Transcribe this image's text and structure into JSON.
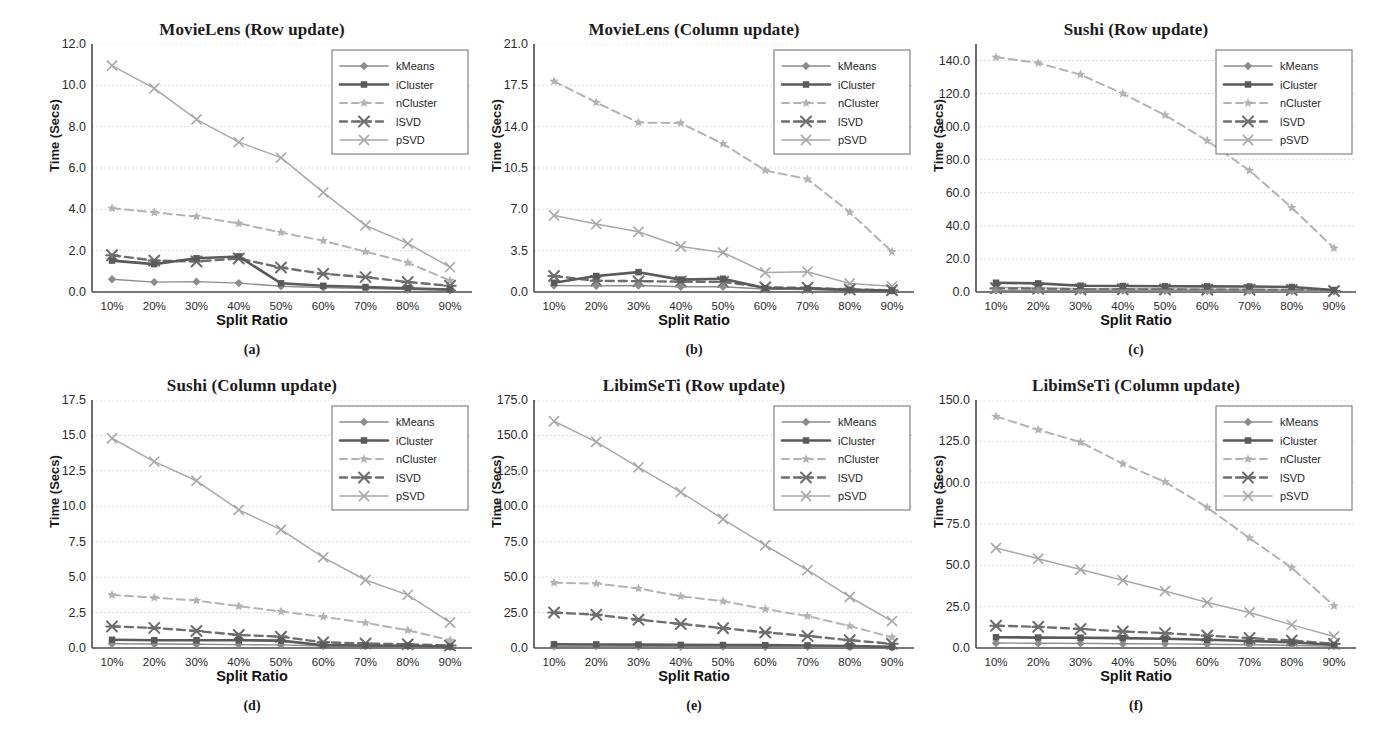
{
  "figure": {
    "xlabel": "Split Ratio",
    "ylabel": "Time (Secs)",
    "categories": [
      "10%",
      "20%",
      "30%",
      "40%",
      "50%",
      "60%",
      "70%",
      "80%",
      "90%"
    ],
    "legend_entries": [
      "kMeans",
      "iCluster",
      "nCluster",
      "lSVD",
      "pSVD"
    ],
    "colors": {
      "kMeans": "#8c8c8c",
      "iCluster": "#5a5a5a",
      "nCluster": "#b3b3b3",
      "lSVD": "#6e6e6e",
      "pSVD": "#a8a8a8",
      "axis": "#4a4a4a",
      "grid": "#d9d9d9",
      "text": "#262626"
    }
  },
  "chart_data": [
    {
      "type": "line",
      "panel": "a",
      "caption": "(a)",
      "title": "MovieLens (Row update)",
      "xlabel": "Split Ratio",
      "ylabel": "Time (Secs)",
      "categories": [
        "10%",
        "20%",
        "30%",
        "40%",
        "50%",
        "60%",
        "70%",
        "80%",
        "90%"
      ],
      "ylim": [
        0.0,
        12.0
      ],
      "yticks": [
        "0.0",
        "2.0",
        "4.0",
        "6.0",
        "8.0",
        "10.0",
        "12.0"
      ],
      "ytick_values": [
        0.0,
        2.0,
        4.0,
        6.0,
        8.0,
        10.0,
        12.0
      ],
      "grid": true,
      "legend_position": "top-right",
      "series": [
        {
          "name": "kMeans",
          "values": [
            0.62,
            0.48,
            0.5,
            0.43,
            0.28,
            0.22,
            0.17,
            0.12,
            0.08
          ]
        },
        {
          "name": "iCluster",
          "values": [
            1.52,
            1.35,
            1.63,
            1.72,
            0.42,
            0.3,
            0.24,
            0.18,
            0.12
          ]
        },
        {
          "name": "nCluster",
          "values": [
            4.05,
            3.85,
            3.65,
            3.32,
            2.88,
            2.48,
            1.95,
            1.42,
            0.55
          ]
        },
        {
          "name": "lSVD",
          "values": [
            1.78,
            1.52,
            1.48,
            1.62,
            1.18,
            0.88,
            0.72,
            0.48,
            0.3
          ]
        },
        {
          "name": "pSVD",
          "values": [
            10.95,
            9.85,
            8.35,
            7.25,
            6.5,
            4.82,
            3.22,
            2.35,
            1.2
          ]
        }
      ]
    },
    {
      "type": "line",
      "panel": "b",
      "caption": "(b)",
      "title": "MovieLens (Column update)",
      "xlabel": "Split Ratio",
      "ylabel": "Time (Secs)",
      "categories": [
        "10%",
        "20%",
        "30%",
        "40%",
        "50%",
        "60%",
        "70%",
        "80%",
        "90%"
      ],
      "ylim": [
        0.0,
        21.0
      ],
      "yticks": [
        "0.0",
        "3.5",
        "7.0",
        "10.5",
        "14.0",
        "17.5",
        "21.0"
      ],
      "ytick_values": [
        0.0,
        3.5,
        7.0,
        10.5,
        14.0,
        17.5,
        21.0
      ],
      "grid": true,
      "legend_position": "top-right",
      "series": [
        {
          "name": "kMeans",
          "values": [
            0.55,
            0.52,
            0.55,
            0.45,
            0.45,
            0.25,
            0.2,
            0.15,
            0.1
          ]
        },
        {
          "name": "iCluster",
          "values": [
            0.78,
            1.35,
            1.68,
            1.05,
            1.12,
            0.32,
            0.3,
            0.18,
            0.12
          ]
        },
        {
          "name": "nCluster",
          "values": [
            17.85,
            16.05,
            14.35,
            14.3,
            12.55,
            10.3,
            9.55,
            6.75,
            3.4
          ]
        },
        {
          "name": "lSVD",
          "values": [
            1.35,
            0.95,
            0.92,
            0.88,
            0.85,
            0.4,
            0.35,
            0.22,
            0.15
          ]
        },
        {
          "name": "pSVD",
          "values": [
            6.48,
            5.75,
            5.1,
            3.85,
            3.35,
            1.65,
            1.72,
            0.72,
            0.48
          ]
        }
      ]
    },
    {
      "type": "line",
      "panel": "c",
      "caption": "(c)",
      "title": "Sushi (Row update)",
      "xlabel": "Split Ratio",
      "ylabel": "Time (Secs)",
      "categories": [
        "10%",
        "20%",
        "30%",
        "40%",
        "50%",
        "60%",
        "70%",
        "80%",
        "90%"
      ],
      "ylim": [
        0.0,
        150.0
      ],
      "yticks": [
        "0.0",
        "20.0",
        "40.0",
        "60.0",
        "80.0",
        "100.0",
        "120.0",
        "140.0"
      ],
      "ytick_values": [
        0.0,
        20.0,
        40.0,
        60.0,
        80.0,
        100.0,
        120.0,
        140.0
      ],
      "grid": true,
      "legend_position": "top-right",
      "series": [
        {
          "name": "kMeans",
          "values": [
            1.0,
            1.0,
            0.9,
            0.9,
            0.8,
            0.8,
            0.7,
            0.6,
            0.3
          ]
        },
        {
          "name": "iCluster",
          "values": [
            5.6,
            5.2,
            3.8,
            3.6,
            3.5,
            3.4,
            3.3,
            3.0,
            1.2
          ]
        },
        {
          "name": "nCluster",
          "values": [
            142.0,
            138.5,
            131.5,
            120.0,
            107.0,
            91.5,
            73.5,
            51.0,
            26.5
          ]
        },
        {
          "name": "lSVD",
          "values": [
            2.2,
            2.0,
            1.6,
            1.6,
            1.5,
            1.4,
            1.3,
            1.2,
            0.6
          ]
        },
        {
          "name": "pSVD",
          "values": [
            2.8,
            2.5,
            2.0,
            1.9,
            1.8,
            1.7,
            1.6,
            1.4,
            0.7
          ]
        }
      ]
    },
    {
      "type": "line",
      "panel": "d",
      "caption": "(d)",
      "title": "Sushi (Column update)",
      "xlabel": "Split Ratio",
      "ylabel": "Time (Secs)",
      "categories": [
        "10%",
        "20%",
        "30%",
        "40%",
        "50%",
        "60%",
        "70%",
        "80%",
        "90%"
      ],
      "ylim": [
        0.0,
        17.5
      ],
      "yticks": [
        "0.0",
        "2.5",
        "5.0",
        "7.5",
        "10.0",
        "12.5",
        "15.0",
        "17.5"
      ],
      "ytick_values": [
        0.0,
        2.5,
        5.0,
        7.5,
        10.0,
        12.5,
        15.0,
        17.5
      ],
      "grid": true,
      "legend_position": "top-right",
      "series": [
        {
          "name": "kMeans",
          "values": [
            0.3,
            0.28,
            0.26,
            0.24,
            0.22,
            0.14,
            0.12,
            0.1,
            0.06
          ]
        },
        {
          "name": "iCluster",
          "values": [
            0.58,
            0.55,
            0.55,
            0.55,
            0.52,
            0.2,
            0.18,
            0.16,
            0.1
          ]
        },
        {
          "name": "nCluster",
          "values": [
            3.75,
            3.55,
            3.35,
            2.95,
            2.58,
            2.2,
            1.78,
            1.25,
            0.55
          ]
        },
        {
          "name": "lSVD",
          "values": [
            1.52,
            1.42,
            1.2,
            0.92,
            0.8,
            0.4,
            0.32,
            0.26,
            0.18
          ]
        },
        {
          "name": "pSVD",
          "values": [
            14.8,
            13.15,
            11.8,
            9.75,
            8.35,
            6.4,
            4.8,
            3.75,
            1.8
          ]
        }
      ]
    },
    {
      "type": "line",
      "panel": "e",
      "caption": "(e)",
      "title": "LibimSeTi (Row update)",
      "xlabel": "Split Ratio",
      "ylabel": "Time (Secs)",
      "categories": [
        "10%",
        "20%",
        "30%",
        "40%",
        "50%",
        "60%",
        "70%",
        "80%",
        "90%"
      ],
      "ylim": [
        0.0,
        175.0
      ],
      "yticks": [
        "0.0",
        "25.0",
        "50.0",
        "75.0",
        "100.0",
        "125.0",
        "150.0",
        "175.0"
      ],
      "ytick_values": [
        0.0,
        25.0,
        50.0,
        75.0,
        100.0,
        125.0,
        150.0,
        175.0
      ],
      "grid": true,
      "legend_position": "top-right",
      "series": [
        {
          "name": "kMeans",
          "values": [
            1.2,
            1.2,
            1.1,
            1.0,
            1.0,
            0.9,
            0.8,
            0.6,
            0.4
          ]
        },
        {
          "name": "iCluster",
          "values": [
            2.6,
            2.5,
            2.4,
            2.2,
            2.1,
            2.0,
            1.8,
            1.4,
            0.8
          ]
        },
        {
          "name": "nCluster",
          "values": [
            46.0,
            45.5,
            42.0,
            36.5,
            33.0,
            27.5,
            22.5,
            15.5,
            7.5
          ]
        },
        {
          "name": "lSVD",
          "values": [
            25.0,
            23.5,
            20.0,
            17.0,
            14.0,
            11.0,
            8.5,
            5.5,
            3.0
          ]
        },
        {
          "name": "pSVD",
          "values": [
            160.0,
            145.5,
            127.5,
            110.0,
            91.0,
            72.5,
            55.0,
            36.0,
            19.0
          ]
        }
      ]
    },
    {
      "type": "line",
      "panel": "f",
      "caption": "(f)",
      "title": "LibimSeTi (Column update)",
      "xlabel": "Split Ratio",
      "ylabel": "Time (Secs)",
      "categories": [
        "10%",
        "20%",
        "30%",
        "40%",
        "50%",
        "60%",
        "70%",
        "80%",
        "90%"
      ],
      "ylim": [
        0.0,
        150.0
      ],
      "yticks": [
        "0.0",
        "25.0",
        "50.0",
        "75.0",
        "100.0",
        "125.0",
        "150.0"
      ],
      "ytick_values": [
        0.0,
        25.0,
        50.0,
        75.0,
        100.0,
        125.0,
        150.0
      ],
      "grid": true,
      "legend_position": "top-right",
      "series": [
        {
          "name": "kMeans",
          "values": [
            3.0,
            2.9,
            2.8,
            2.6,
            2.5,
            2.3,
            2.0,
            1.7,
            1.0
          ]
        },
        {
          "name": "iCluster",
          "values": [
            6.5,
            6.3,
            6.2,
            6.0,
            5.6,
            5.0,
            4.2,
            3.5,
            1.8
          ]
        },
        {
          "name": "nCluster",
          "values": [
            140.0,
            132.0,
            124.5,
            111.5,
            100.5,
            85.0,
            66.5,
            48.5,
            25.5
          ]
        },
        {
          "name": "lSVD",
          "values": [
            13.5,
            12.8,
            11.5,
            10.0,
            9.0,
            7.5,
            6.0,
            4.5,
            2.5
          ]
        },
        {
          "name": "pSVD",
          "values": [
            60.5,
            54.0,
            47.5,
            41.0,
            34.5,
            27.5,
            21.5,
            14.0,
            7.0
          ]
        }
      ]
    }
  ]
}
